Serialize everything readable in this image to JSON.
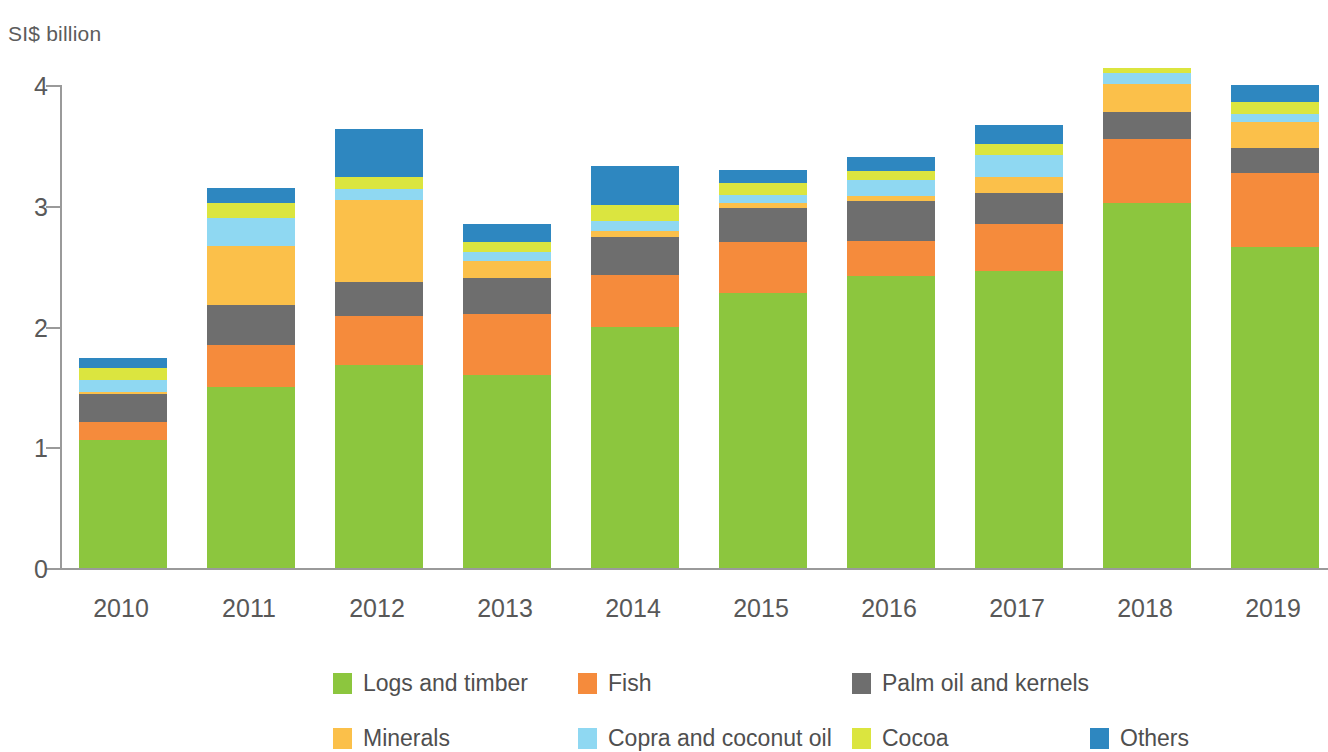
{
  "axis": {
    "y_unit_label": "SI$ billion",
    "y_ticks": [
      "0",
      "1",
      "2",
      "3",
      "4"
    ],
    "x_labels": [
      "2010",
      "2011",
      "2012",
      "2013",
      "2014",
      "2015",
      "2016",
      "2017",
      "2018",
      "2019"
    ]
  },
  "legend": {
    "row1": [
      {
        "label": "Logs and timber",
        "color": "#8cc63e"
      },
      {
        "label": "Fish",
        "color": "#f58b3c"
      },
      {
        "label": "Palm oil and kernels",
        "color": "#6e6e6e"
      }
    ],
    "row2": [
      {
        "label": "Minerals",
        "color": "#fbc04a"
      },
      {
        "label": "Copra and coconut oil",
        "color": "#8fd8f2"
      },
      {
        "label": "Cocoa",
        "color": "#dbe53f"
      },
      {
        "label": "Others",
        "color": "#2e87c0"
      }
    ]
  },
  "chart_data": {
    "type": "bar",
    "title": "",
    "xlabel": "",
    "ylabel": "SI$ billion",
    "ylim": [
      0,
      4
    ],
    "yticks": [
      0,
      1,
      2,
      3,
      4
    ],
    "grid": false,
    "stacked": true,
    "legend_position": "bottom",
    "categories": [
      "2010",
      "2011",
      "2012",
      "2013",
      "2014",
      "2015",
      "2016",
      "2017",
      "2018",
      "2019"
    ],
    "series": [
      {
        "name": "Logs and timber",
        "color": "#8cc63e",
        "values": [
          1.06,
          1.5,
          1.68,
          1.6,
          2.0,
          2.28,
          2.42,
          2.46,
          3.02,
          2.66
        ]
      },
      {
        "name": "Fish",
        "color": "#f58b3c",
        "values": [
          0.15,
          0.35,
          0.41,
          0.5,
          0.43,
          0.42,
          0.29,
          0.39,
          0.53,
          0.61
        ]
      },
      {
        "name": "Palm oil and kernels",
        "color": "#6e6e6e",
        "values": [
          0.23,
          0.33,
          0.28,
          0.3,
          0.31,
          0.28,
          0.33,
          0.26,
          0.23,
          0.21
        ]
      },
      {
        "name": "Minerals",
        "color": "#fbc04a",
        "values": [
          0.02,
          0.49,
          0.68,
          0.14,
          0.05,
          0.04,
          0.04,
          0.13,
          0.23,
          0.21
        ]
      },
      {
        "name": "Copra and coconut oil",
        "color": "#8fd8f2",
        "values": [
          0.1,
          0.23,
          0.09,
          0.08,
          0.08,
          0.07,
          0.13,
          0.18,
          0.09,
          0.07
        ]
      },
      {
        "name": "Cocoa",
        "color": "#dbe53f",
        "values": [
          0.1,
          0.12,
          0.1,
          0.08,
          0.14,
          0.1,
          0.08,
          0.09,
          0.04,
          0.1
        ]
      },
      {
        "name": "Others",
        "color": "#2e87c0",
        "values": [
          0.08,
          0.13,
          0.4,
          0.15,
          0.32,
          0.11,
          0.11,
          0.16,
          0.0,
          0.14
        ]
      }
    ],
    "totals": [
      1.79,
      3.15,
      3.64,
      3.25,
      3.33,
      3.3,
      3.4,
      3.67,
      3.99,
      3.73
    ]
  },
  "geometry": {
    "plot_height_px": 483,
    "y_max": 4,
    "bar_width_px": 88,
    "bar_pitch_px": 128,
    "bar_first_left_px": 17
  }
}
